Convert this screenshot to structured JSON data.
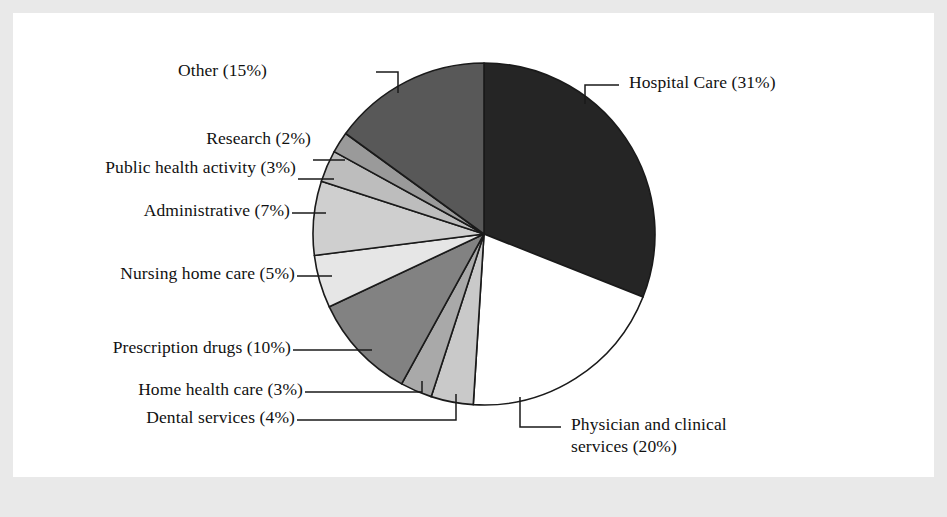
{
  "figure": {
    "background_color": "#e9e9e9",
    "panel_color": "#ffffff",
    "outline_color": "#1a1a1a"
  },
  "chart_data": {
    "type": "pie",
    "title": "",
    "subtitle": "",
    "xlabel": "",
    "ylabel": "",
    "legend_position": "none",
    "grid": false,
    "start_angle_deg": 0,
    "direction": "clockwise",
    "units": "percent",
    "total": 100,
    "categories": [
      "Hospital Care",
      "Physician and clinical services",
      "Dental services",
      "Home health care",
      "Prescription drugs",
      "Nursing home care",
      "Administrative",
      "Public health activity",
      "Research",
      "Other"
    ],
    "values": [
      31,
      20,
      4,
      3,
      10,
      5,
      7,
      3,
      2,
      15
    ],
    "slices": [
      {
        "name": "Hospital Care",
        "value": 31,
        "label": "Hospital Care (31%)",
        "color": "#252525",
        "label_side": "right"
      },
      {
        "name": "Physician and clinical services",
        "value": 20,
        "label": "Physician and clinical",
        "label_line2": "services (20%)",
        "color": "#ffffff",
        "label_side": "right"
      },
      {
        "name": "Dental services",
        "value": 4,
        "label": "Dental services (4%)",
        "color": "#c9c9c9",
        "label_side": "left"
      },
      {
        "name": "Home health care",
        "value": 3,
        "label": "Home health care (3%)",
        "color": "#a9a9a9",
        "label_side": "left"
      },
      {
        "name": "Prescription drugs",
        "value": 10,
        "label": "Prescription drugs (10%)",
        "color": "#828282",
        "label_side": "left"
      },
      {
        "name": "Nursing home care",
        "value": 5,
        "label": "Nursing home care (5%)",
        "color": "#e6e6e6",
        "label_side": "left"
      },
      {
        "name": "Administrative",
        "value": 7,
        "label": "Administrative (7%)",
        "color": "#cfcfcf",
        "label_side": "left"
      },
      {
        "name": "Public health activity",
        "value": 3,
        "label": "Public health activity (3%)",
        "color": "#bdbdbd",
        "label_side": "left"
      },
      {
        "name": "Research",
        "value": 2,
        "label": "Research (2%)",
        "color": "#9a9a9a",
        "label_side": "left"
      },
      {
        "name": "Other",
        "value": 15,
        "label": "Other (15%)",
        "color": "#585858",
        "label_side": "left"
      }
    ]
  }
}
